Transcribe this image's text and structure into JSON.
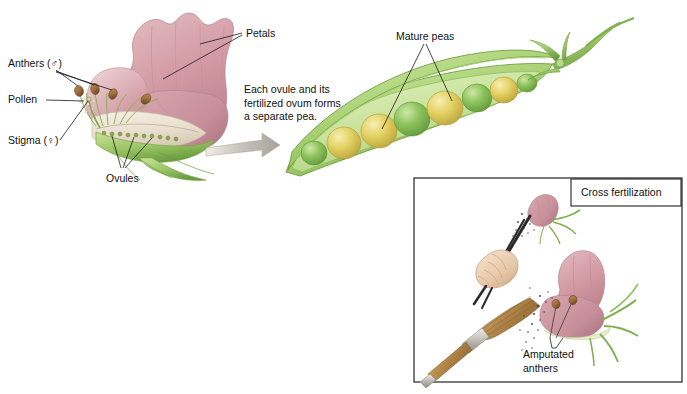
{
  "figure": {
    "title_visible": false,
    "background": "#ffffff",
    "panels": [
      "pea-flower-anatomy",
      "pea-pod-mature",
      "cross-fertilization-inset"
    ]
  },
  "labels": {
    "petals": "Petals",
    "anthers": "Anthers (♂)",
    "pollen": "Pollen",
    "stigma": "Stigma (♀)",
    "ovules": "Ovules",
    "mature_peas": "Mature peas",
    "amputated_anthers_line1": "Amputated",
    "amputated_anthers_line2": "anthers"
  },
  "caption": {
    "line1": "Each ovule and its",
    "line2": "fertilized ovum forms",
    "line3": "a separate pea."
  },
  "inset": {
    "title": "Cross fertilization",
    "elements": [
      "forceps-with-flower",
      "hand",
      "pollen-brush",
      "pollen-grains",
      "flower-with-amputated-anthers"
    ]
  },
  "colors": {
    "petal_pink": "#d49ba4",
    "petal_pink_dark": "#b87d89",
    "petal_pink_light": "#e5bcc2",
    "pod_green": "#9ccb6a",
    "pod_green_light": "#cfe6a4",
    "pod_green_dark": "#6fa243",
    "pea_green": "#86c05e",
    "pea_yellow": "#e3d25f",
    "anther_brown": "#9b6b3c",
    "stem_green": "#8fbe63",
    "leader_line": "#1a1a1a",
    "arrow_gray": "#b9b4ae",
    "text": "#111111",
    "inset_border": "#222222"
  },
  "arrow": {
    "direction": "right",
    "meaning": "flower develops into pod"
  },
  "pod": {
    "pea_count": 7,
    "pea_sequence": [
      "green",
      "yellow",
      "yellow",
      "green",
      "yellow",
      "green",
      "yellow"
    ]
  }
}
